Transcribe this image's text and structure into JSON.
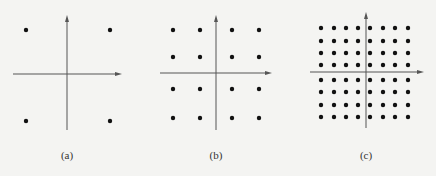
{
  "panels": [
    {
      "label": "(a)",
      "origin": [
        67,
        74
      ],
      "xaxis": [
        13,
        122
      ],
      "yaxis": [
        15,
        130
      ],
      "xs": [
        26,
        110
      ],
      "ys": [
        30,
        121
      ],
      "labelPos": [
        67,
        149
      ]
    },
    {
      "label": "(b)",
      "origin": [
        216,
        73
      ],
      "xaxis": [
        160,
        272
      ],
      "yaxis": [
        15,
        130
      ],
      "xs": [
        173,
        200,
        232,
        259
      ],
      "ys": [
        30,
        57,
        89,
        118
      ],
      "labelPos": [
        216,
        149
      ]
    },
    {
      "label": "(c)",
      "origin": [
        366,
        72
      ],
      "xaxis": [
        310,
        424
      ],
      "yaxis": [
        12,
        128
      ],
      "xs": [
        321,
        334,
        346,
        358,
        370,
        383,
        395,
        408
      ],
      "ys": [
        28,
        41,
        53,
        65,
        80,
        92,
        105,
        117
      ],
      "labelPos": [
        366,
        149
      ]
    }
  ],
  "colors": {
    "dot": "#111111",
    "axis": "#555555"
  }
}
